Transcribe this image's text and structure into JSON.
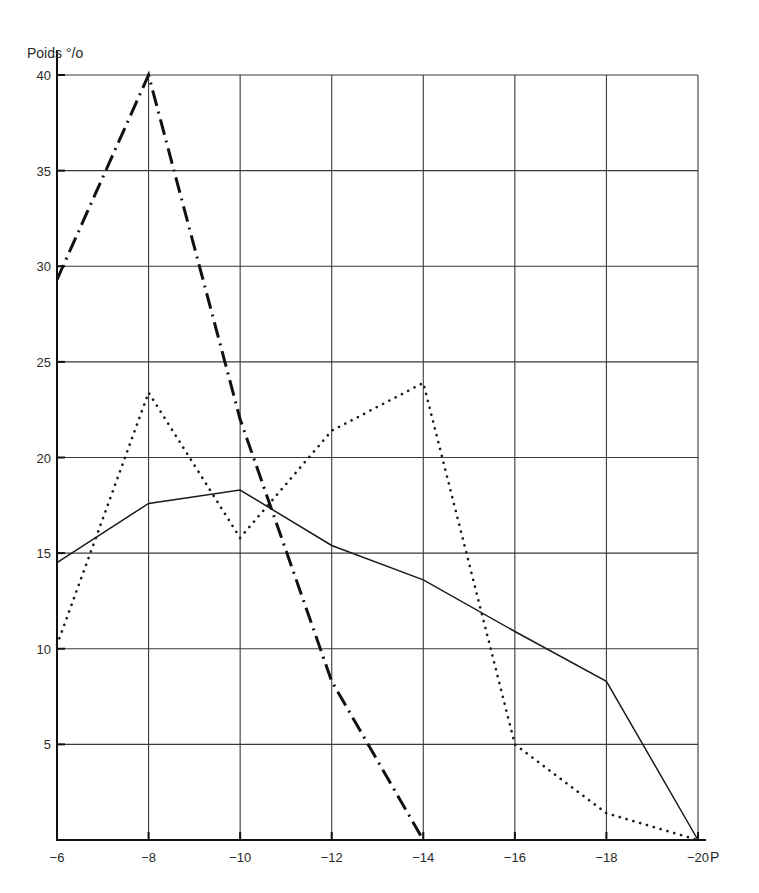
{
  "chart_data": {
    "type": "line",
    "title": "",
    "xlabel": "P",
    "ylabel": "Poids °/o",
    "x": [
      -6,
      -8,
      -10,
      -12,
      -14,
      -16,
      -18,
      -20
    ],
    "x_tick_labels": [
      "−6",
      "−8",
      "−10",
      "−12",
      "−14",
      "−16",
      "−18",
      "−20"
    ],
    "y_ticks": [
      5,
      10,
      15,
      20,
      25,
      30,
      35,
      40
    ],
    "y_tick_labels": [
      "5",
      "10",
      "15",
      "20",
      "25",
      "30",
      "35",
      "40"
    ],
    "xlim": [
      -6,
      -20
    ],
    "ylim": [
      0,
      40
    ],
    "grid": true,
    "legend": null,
    "series": [
      {
        "name": "solid",
        "style": "solid",
        "color": "#1a1a1a",
        "values": [
          14.5,
          17.6,
          18.3,
          15.4,
          13.6,
          10.9,
          8.3,
          0
        ]
      },
      {
        "name": "dotted",
        "style": "dotted",
        "color": "#1a1a1a",
        "values": [
          10.2,
          23.4,
          15.8,
          21.4,
          23.9,
          5.0,
          1.4,
          0
        ]
      },
      {
        "name": "dash-dot",
        "style": "dash-dot",
        "color": "#111111",
        "x": [
          -6,
          -8,
          -10,
          -12,
          -14
        ],
        "values": [
          29.3,
          40,
          22.0,
          8.3,
          0
        ]
      }
    ]
  },
  "axes": {
    "y_title": "Poids °/o",
    "x_title": "P"
  }
}
